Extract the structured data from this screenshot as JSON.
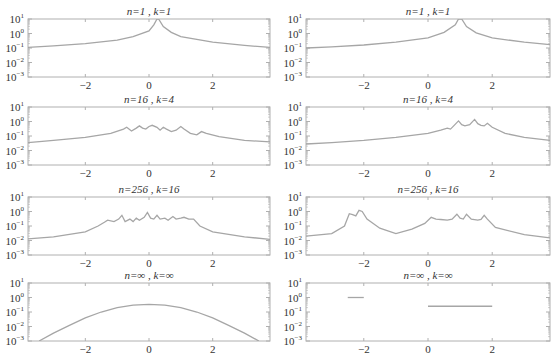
{
  "chart_data": {
    "type": "line",
    "layout": {
      "rows": 4,
      "cols": 2,
      "xlim": [
        -3.8,
        3.8
      ],
      "ylim_log10": [
        -3,
        1
      ],
      "yscale": "log",
      "grid": false
    },
    "xticks": [
      -2,
      0,
      2
    ],
    "xtick_labels": [
      "−2",
      "0",
      "2"
    ],
    "yticks_log10": [
      1,
      0,
      -1,
      -2,
      -3
    ],
    "ytick_labels": [
      "10^1",
      "10^0",
      "10^-1",
      "10^-2",
      "10^-3"
    ],
    "line_color": "#a6a6a6",
    "axis_color": "#b0b0b0",
    "panels": [
      {
        "title": "n=1 , k=1",
        "row": 0,
        "col": 0,
        "points": [
          [
            -3.8,
            0.11
          ],
          [
            -3,
            0.14
          ],
          [
            -2,
            0.2
          ],
          [
            -1,
            0.35
          ],
          [
            -0.5,
            0.6
          ],
          [
            0,
            1.5
          ],
          [
            0.15,
            4
          ],
          [
            0.25,
            12
          ],
          [
            0.3,
            12
          ],
          [
            0.45,
            3
          ],
          [
            0.7,
            1.2
          ],
          [
            1,
            0.6
          ],
          [
            2,
            0.25
          ],
          [
            3,
            0.15
          ],
          [
            3.8,
            0.11
          ]
        ]
      },
      {
        "title": "n=1 , k=1",
        "row": 0,
        "col": 1,
        "points": [
          [
            -3.8,
            0.1
          ],
          [
            -3,
            0.12
          ],
          [
            -2,
            0.16
          ],
          [
            -1,
            0.25
          ],
          [
            0,
            0.5
          ],
          [
            0.5,
            1.2
          ],
          [
            0.85,
            4
          ],
          [
            0.95,
            12
          ],
          [
            1.05,
            12
          ],
          [
            1.2,
            3
          ],
          [
            1.5,
            1.1
          ],
          [
            2,
            0.5
          ],
          [
            3,
            0.25
          ],
          [
            3.8,
            0.17
          ]
        ]
      },
      {
        "title": "n=16 , k=4",
        "row": 1,
        "col": 0,
        "points": [
          [
            -3.8,
            0.035
          ],
          [
            -3,
            0.05
          ],
          [
            -2,
            0.08
          ],
          [
            -1.2,
            0.15
          ],
          [
            -0.8,
            0.3
          ],
          [
            -0.7,
            0.4
          ],
          [
            -0.55,
            0.22
          ],
          [
            -0.4,
            0.35
          ],
          [
            -0.3,
            0.5
          ],
          [
            -0.2,
            0.35
          ],
          [
            -0.1,
            0.3
          ],
          [
            0,
            0.45
          ],
          [
            0.1,
            0.55
          ],
          [
            0.25,
            0.4
          ],
          [
            0.35,
            0.25
          ],
          [
            0.45,
            0.4
          ],
          [
            0.55,
            0.3
          ],
          [
            0.7,
            0.2
          ],
          [
            0.85,
            0.25
          ],
          [
            1,
            0.45
          ],
          [
            1.1,
            0.3
          ],
          [
            1.3,
            0.15
          ],
          [
            1.5,
            0.12
          ],
          [
            1.65,
            0.2
          ],
          [
            1.8,
            0.15
          ],
          [
            2.2,
            0.09
          ],
          [
            3,
            0.05
          ],
          [
            3.8,
            0.04
          ]
        ]
      },
      {
        "title": "n=16 , k=4",
        "row": 1,
        "col": 1,
        "points": [
          [
            -3.8,
            0.028
          ],
          [
            -3,
            0.035
          ],
          [
            -2,
            0.05
          ],
          [
            -1,
            0.08
          ],
          [
            0,
            0.15
          ],
          [
            0.4,
            0.25
          ],
          [
            0.6,
            0.35
          ],
          [
            0.7,
            0.3
          ],
          [
            0.8,
            0.5
          ],
          [
            0.95,
            1.1
          ],
          [
            1.05,
            0.6
          ],
          [
            1.15,
            0.5
          ],
          [
            1.3,
            0.6
          ],
          [
            1.45,
            1.4
          ],
          [
            1.55,
            0.7
          ],
          [
            1.65,
            0.55
          ],
          [
            1.75,
            0.5
          ],
          [
            1.85,
            0.75
          ],
          [
            2,
            0.4
          ],
          [
            2.4,
            0.15
          ],
          [
            3,
            0.08
          ],
          [
            3.8,
            0.05
          ]
        ]
      },
      {
        "title": "n=256 , k=16",
        "row": 2,
        "col": 0,
        "points": [
          [
            -3.8,
            0.013
          ],
          [
            -3,
            0.018
          ],
          [
            -2,
            0.04
          ],
          [
            -1.6,
            0.1
          ],
          [
            -1.4,
            0.18
          ],
          [
            -1.3,
            0.25
          ],
          [
            -1.1,
            0.2
          ],
          [
            -0.95,
            0.3
          ],
          [
            -0.85,
            0.55
          ],
          [
            -0.75,
            0.2
          ],
          [
            -0.6,
            0.3
          ],
          [
            -0.5,
            0.2
          ],
          [
            -0.4,
            0.35
          ],
          [
            -0.3,
            0.25
          ],
          [
            -0.15,
            0.4
          ],
          [
            -0.05,
            0.85
          ],
          [
            0.05,
            0.35
          ],
          [
            0.15,
            0.3
          ],
          [
            0.25,
            0.55
          ],
          [
            0.35,
            0.3
          ],
          [
            0.5,
            0.35
          ],
          [
            0.6,
            0.25
          ],
          [
            0.75,
            0.45
          ],
          [
            0.85,
            0.3
          ],
          [
            1,
            0.35
          ],
          [
            1.1,
            0.4
          ],
          [
            1.25,
            0.3
          ],
          [
            1.4,
            0.3
          ],
          [
            1.6,
            0.1
          ],
          [
            2,
            0.04
          ],
          [
            3,
            0.018
          ],
          [
            3.8,
            0.012
          ]
        ]
      },
      {
        "title": "n=256 , k=16",
        "row": 2,
        "col": 1,
        "points": [
          [
            -3.8,
            0.02
          ],
          [
            -3,
            0.03
          ],
          [
            -2.6,
            0.1
          ],
          [
            -2.45,
            0.7
          ],
          [
            -2.35,
            0.6
          ],
          [
            -2.25,
            0.5
          ],
          [
            -2.15,
            1.2
          ],
          [
            -2.05,
            1
          ],
          [
            -1.9,
            0.3
          ],
          [
            -1.5,
            0.07
          ],
          [
            -1,
            0.03
          ],
          [
            -0.5,
            0.06
          ],
          [
            -0.1,
            0.15
          ],
          [
            0.1,
            0.4
          ],
          [
            0.25,
            0.3
          ],
          [
            0.4,
            0.28
          ],
          [
            0.6,
            0.25
          ],
          [
            0.75,
            0.3
          ],
          [
            0.9,
            0.65
          ],
          [
            1,
            0.35
          ],
          [
            1.1,
            0.3
          ],
          [
            1.2,
            0.65
          ],
          [
            1.35,
            0.3
          ],
          [
            1.55,
            0.25
          ],
          [
            1.65,
            0.28
          ],
          [
            1.75,
            0.55
          ],
          [
            1.85,
            0.3
          ],
          [
            2.1,
            0.08
          ],
          [
            3,
            0.025
          ],
          [
            3.8,
            0.015
          ]
        ]
      },
      {
        "title": "n=∞ , k=∞",
        "row": 3,
        "col": 0,
        "points": [
          [
            -3.45,
            0.001
          ],
          [
            -3,
            0.0035
          ],
          [
            -2.5,
            0.012
          ],
          [
            -2,
            0.04
          ],
          [
            -1.5,
            0.1
          ],
          [
            -1,
            0.2
          ],
          [
            -0.5,
            0.3
          ],
          [
            0,
            0.34
          ],
          [
            0.5,
            0.3
          ],
          [
            1,
            0.2
          ],
          [
            1.5,
            0.1
          ],
          [
            2,
            0.04
          ],
          [
            2.5,
            0.012
          ],
          [
            3,
            0.0035
          ],
          [
            3.45,
            0.001
          ]
        ]
      },
      {
        "title": "n=∞ , k=∞",
        "row": 3,
        "col": 1,
        "segments": [
          {
            "x": [
              -2.5,
              -2.0
            ],
            "y": 1.0
          },
          {
            "x": [
              0.0,
              2.0
            ],
            "y": 0.25
          }
        ]
      }
    ]
  }
}
